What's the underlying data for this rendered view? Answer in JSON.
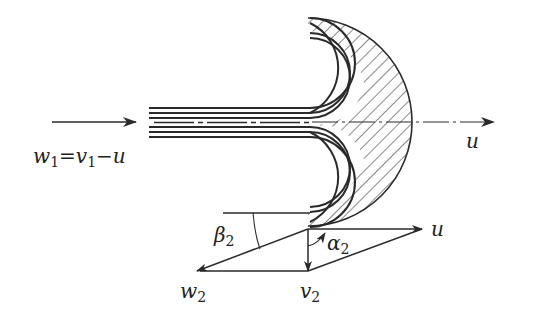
{
  "figure": {
    "labels": {
      "inlet_relation": {
        "w": "w",
        "w_sub": "1",
        "eq": "=",
        "v": "v",
        "v_sub": "1",
        "minus": "−",
        "u": "u"
      },
      "bucket_velocity": "u",
      "triangle_u": "u",
      "beta": {
        "sym": "β",
        "sub": "2"
      },
      "alpha": {
        "sym": "α",
        "sub": "2"
      },
      "w2": {
        "sym": "w",
        "sub": "2"
      },
      "v2": {
        "sym": "v",
        "sub": "2"
      }
    },
    "colors": {
      "ink": "#2a2a2a",
      "background": "#ffffff"
    }
  }
}
